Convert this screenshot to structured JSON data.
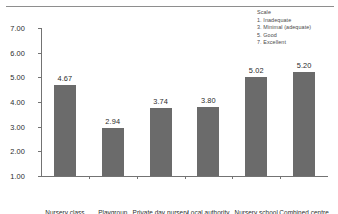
{
  "chart_data": {
    "type": "bar",
    "title": "",
    "xlabel": "",
    "ylabel": "",
    "categories": [
      "Nursery class",
      "Playgroup",
      "Private day nursery",
      "Local authority",
      "Nursery school",
      "Combined centre"
    ],
    "values": [
      4.67,
      2.94,
      3.74,
      3.8,
      5.02,
      5.2
    ],
    "value_labels": [
      "4.67",
      "2.94",
      "3.74",
      "3.80",
      "5.02",
      "5.20"
    ],
    "ylim": [
      1.0,
      7.0
    ],
    "ytick_values": [
      1.0,
      2.0,
      3.0,
      4.0,
      5.0,
      6.0,
      7.0
    ],
    "ytick_labels": [
      "1.00",
      "2.00",
      "3.00",
      "4.00",
      "5.00",
      "6.00",
      "7.00"
    ],
    "grid": false,
    "legend_position": "top-right",
    "bar_color": "#6b6b6b",
    "axis_color": "#737373",
    "text_color": "#2b2b2b"
  },
  "legend": {
    "title": "Scale",
    "items": [
      "1. Inadequate",
      "3. Minimal (adequate)",
      "5. Good",
      "7. Excellent"
    ]
  }
}
